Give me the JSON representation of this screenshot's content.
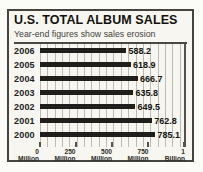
{
  "title": "U.S. TOTAL ALBUM SALES",
  "subtitle": "Year-end figures show sales erosion",
  "chart_data": {
    "type": "bar",
    "orientation": "horizontal",
    "title": "U.S. TOTAL ALBUM SALES",
    "subtitle": "Year-end figures show sales erosion",
    "categories": [
      "2006",
      "2005",
      "2004",
      "2003",
      "2002",
      "2001",
      "2000"
    ],
    "values": [
      588.2,
      618.9,
      666.7,
      635.8,
      649.5,
      762.8,
      785.1
    ],
    "unit": "millions of albums",
    "xlim": [
      0,
      1000
    ],
    "grid": true,
    "x_ticks": [
      {
        "number": "0",
        "unit": "Million",
        "pos": 0
      },
      {
        "number": "250",
        "unit": "Million",
        "pos": 25
      },
      {
        "number": "500",
        "unit": "Million",
        "pos": 50
      },
      {
        "number": "750",
        "unit": "Million",
        "pos": 75
      },
      {
        "number": "1",
        "unit": "Billion",
        "pos": 100
      }
    ],
    "colors": {
      "bar": "#201f1c",
      "grid_line": "#bcbab2",
      "frame": "#46443f",
      "panel_background": "#f7f6f1"
    }
  }
}
